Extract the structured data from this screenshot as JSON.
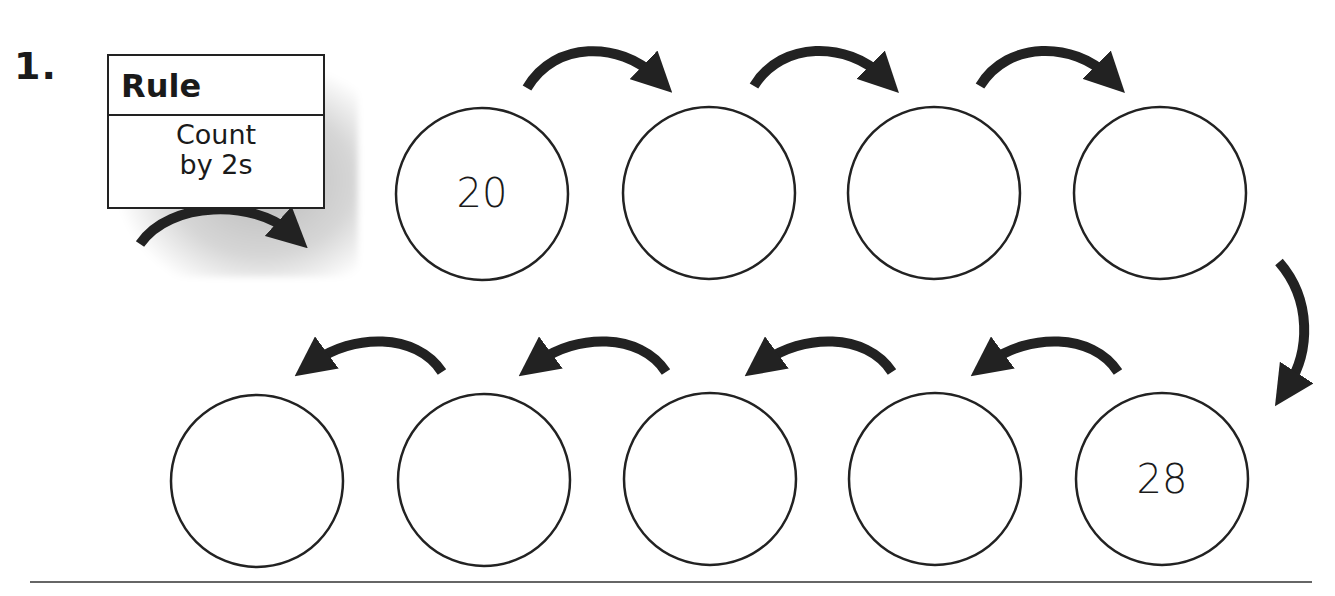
{
  "problem": {
    "number": "1.",
    "rule": {
      "title": "Rule",
      "line1": "Count",
      "line2": "by 2s"
    },
    "circles": [
      {
        "row": "top",
        "index": 0,
        "value": "20"
      },
      {
        "row": "top",
        "index": 1,
        "value": ""
      },
      {
        "row": "top",
        "index": 2,
        "value": ""
      },
      {
        "row": "top",
        "index": 3,
        "value": ""
      },
      {
        "row": "bottom",
        "index": 4,
        "value": "28"
      },
      {
        "row": "bottom",
        "index": 5,
        "value": ""
      },
      {
        "row": "bottom",
        "index": 6,
        "value": ""
      },
      {
        "row": "bottom",
        "index": 7,
        "value": ""
      },
      {
        "row": "bottom",
        "index": 8,
        "value": ""
      }
    ]
  },
  "colors": {
    "ink": "#222222",
    "paper": "#ffffff"
  }
}
